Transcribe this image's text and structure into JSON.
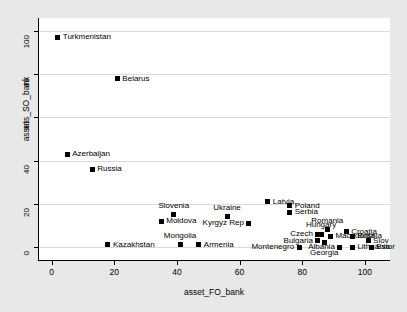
{
  "chart_data": {
    "type": "scatter",
    "title": "",
    "xlabel": "asset_FO_bank",
    "ylabel": "assets_SO_bank",
    "xlim": [
      -4,
      108
    ],
    "ylim": [
      -6,
      106
    ],
    "xticks": [
      0,
      20,
      40,
      60,
      80,
      100
    ],
    "yticks": [
      0,
      20,
      40,
      60,
      80,
      100
    ],
    "grid": true,
    "legend": "none",
    "marker_color": "#000000",
    "points": [
      {
        "label": "Turkmenistan",
        "x": 2,
        "y": 97,
        "pos": "right"
      },
      {
        "label": "Belarus",
        "x": 21,
        "y": 78,
        "pos": "right"
      },
      {
        "label": "Azerbaijan",
        "x": 5,
        "y": 43,
        "pos": "right"
      },
      {
        "label": "Russia",
        "x": 13,
        "y": 36,
        "pos": "right"
      },
      {
        "label": "Latvia",
        "x": 69,
        "y": 21,
        "pos": "right"
      },
      {
        "label": "Poland",
        "x": 76,
        "y": 19,
        "pos": "right"
      },
      {
        "label": "Serbia",
        "x": 76,
        "y": 16,
        "pos": "right"
      },
      {
        "label": "Slovenia",
        "x": 39,
        "y": 15,
        "pos": "above"
      },
      {
        "label": "Ukraine",
        "x": 56,
        "y": 14,
        "pos": "above"
      },
      {
        "label": "Moldova",
        "x": 35,
        "y": 12,
        "pos": "right"
      },
      {
        "label": "Kyrgyz Rep",
        "x": 63,
        "y": 11,
        "pos": "left"
      },
      {
        "label": "Romania",
        "x": 88,
        "y": 8,
        "pos": "above"
      },
      {
        "label": "Croatia",
        "x": 94,
        "y": 7,
        "pos": "right"
      },
      {
        "label": "Czech",
        "x": 85,
        "y": 6,
        "pos": "left"
      },
      {
        "label": "Hungary",
        "x": 86,
        "y": 6,
        "pos": "above"
      },
      {
        "label": "Macedonia",
        "x": 89,
        "y": 5,
        "pos": "right"
      },
      {
        "label": "Bosnia",
        "x": 96,
        "y": 5,
        "pos": "right"
      },
      {
        "label": "Bulgaria",
        "x": 85,
        "y": 3,
        "pos": "left"
      },
      {
        "label": "Georgia",
        "x": 87,
        "y": 2,
        "pos": "below"
      },
      {
        "label": "Slov",
        "x": 101,
        "y": 3,
        "pos": "right"
      },
      {
        "label": "Mongolia",
        "x": 41,
        "y": 1,
        "pos": "above"
      },
      {
        "label": "Kazakhstan",
        "x": 18,
        "y": 1,
        "pos": "right"
      },
      {
        "label": "Armenia",
        "x": 47,
        "y": 1,
        "pos": "right"
      },
      {
        "label": "Montenegro",
        "x": 79,
        "y": 0,
        "pos": "left"
      },
      {
        "label": "Albania",
        "x": 92,
        "y": 0,
        "pos": "left"
      },
      {
        "label": "Lithuania",
        "x": 96,
        "y": 0,
        "pos": "right"
      },
      {
        "label": "Estor",
        "x": 102,
        "y": 0,
        "pos": "right"
      }
    ]
  }
}
